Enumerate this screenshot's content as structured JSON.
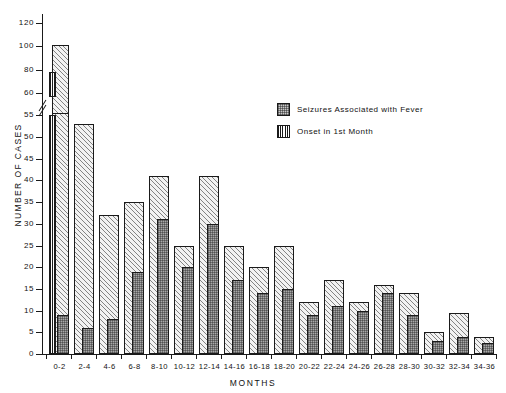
{
  "chart_data": {
    "type": "bar",
    "title": "",
    "xlabel": "MONTHS",
    "ylabel": "NUMBER OF CASES",
    "categories": [
      "0-2",
      "2-4",
      "4-6",
      "6-8",
      "8-10",
      "10-12",
      "12-14",
      "14-16",
      "16-18",
      "18-20",
      "20-22",
      "22-24",
      "24-26",
      "26-28",
      "28-30",
      "30-32",
      "32-34",
      "34-36"
    ],
    "ylim": [
      0,
      120
    ],
    "y_ticks": [
      0,
      5,
      10,
      15,
      20,
      25,
      30,
      35,
      40,
      45,
      50,
      55,
      60,
      80,
      100,
      120
    ],
    "y_axis_break_between": [
      55,
      60
    ],
    "grid": false,
    "legend_position": "upper-right-inside",
    "series": [
      {
        "name": "Total cases (outline bar)",
        "fill": "diagonal-hatch",
        "values": [
          101,
          53,
          32,
          35,
          41,
          25,
          41,
          25,
          20,
          25,
          12,
          17,
          12,
          16,
          14,
          5,
          9.5,
          4
        ]
      },
      {
        "name": "Seizures Associated with Fever",
        "fill": "stipple-gray",
        "values": [
          9,
          6,
          8,
          19,
          31,
          20,
          30,
          17,
          14,
          15,
          9,
          11,
          10,
          14,
          9,
          3,
          4,
          2.5
        ]
      },
      {
        "name": "Onset in 1st Month",
        "fill": "vertical-stripe",
        "values": [
          78,
          0,
          0,
          0,
          0,
          0,
          0,
          0,
          0,
          0,
          0,
          0,
          0,
          0,
          0,
          0,
          0,
          0
        ]
      }
    ]
  },
  "legend": {
    "items": [
      {
        "label": "Seizures Associated with Fever",
        "swatch": "fever"
      },
      {
        "label": "Onset in 1st  Month",
        "swatch": "onset"
      }
    ]
  },
  "axes": {
    "y_title": "NUMBER  OF  CASES",
    "x_title": "MONTHS"
  }
}
